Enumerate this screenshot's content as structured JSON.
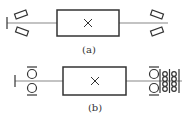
{
  "figures": [
    {
      "id": "a",
      "caption": "(a)",
      "box_symbol": "×",
      "support_type": "angular-contact bearings (tilted)"
    },
    {
      "id": "b",
      "caption": "(b)",
      "box_symbol": "×",
      "support_type": "ball bearings (circles)"
    }
  ],
  "colors": {
    "stroke": "#333333",
    "shaft": "#888888",
    "background": "#ffffff"
  }
}
